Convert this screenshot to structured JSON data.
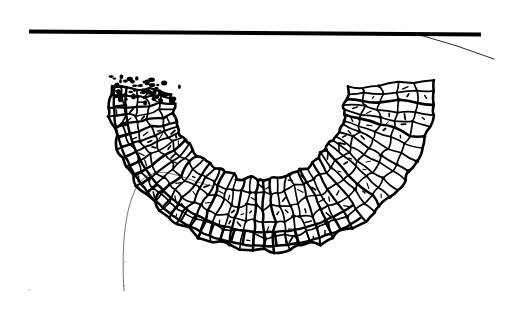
{
  "figure": {
    "style": "black ink line drawing on white ground",
    "alt_text": "A band of irregular open crochet netting hangs from a straight horizontal rod near the top of the frame, curving down and sweeping to the left into a crescent; a fine loose thread trails from the lower left tip and another thin thread runs off to the right from where the band meets the rod.",
    "background_color": "#ffffff",
    "ink_color": "#000000",
    "width": 519,
    "height": 313
  },
  "elements": {
    "rod": {
      "name": "horizontal rod",
      "description": "thick solid black bar crossing the upper part of the image, slightly tilted",
      "x1": 29,
      "y1": 31.5,
      "x2": 481,
      "y2": 34.5,
      "thickness": 4,
      "color": "#000000"
    },
    "mesh_band": {
      "name": "crocheted mesh band",
      "description": "open irregular netting of roughly square cells arranged in three to four longitudinal rows, curving from the rod down and to the left",
      "cell_rows": 4,
      "cell_count_estimate": 230,
      "top_attachment_x_left": 348,
      "top_attachment_x_right": 430,
      "lowest_point_y": 246,
      "leftmost_point_x": 206,
      "rightmost_point_x": 436,
      "color": "#000000"
    },
    "inner_ladder": {
      "name": "inner ladder edge",
      "description": "dense band of short parallel bars along the concave inner edge of the curve",
      "color": "#000000"
    },
    "thread_tail_left": {
      "name": "loose thread tail at left tip",
      "description": "fine hairline thread leaving the lower left end of the band, arcing up and left then falling away and fading out near the bottom",
      "start_x": 212,
      "start_y": 186,
      "peak_x": 152,
      "peak_y": 174,
      "end_x": 124,
      "end_y": 291,
      "thickness": 0.7,
      "color": "#111111"
    },
    "thread_tail_right": {
      "name": "working thread at rod",
      "description": "fine hairline thread running from beneath the rod at the band's top right down to the right edge",
      "start_x": 420,
      "start_y": 35,
      "end_x": 494,
      "end_y": 59,
      "thickness": 0.9,
      "color": "#111111"
    },
    "speck_marks": {
      "name": "incidental ink specks",
      "description": "a few faint scattered dots in the lower left quadrant of the plate",
      "count": 3,
      "color": "#cccccc"
    }
  }
}
